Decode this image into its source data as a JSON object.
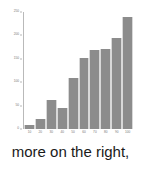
{
  "caption": "more on the right,",
  "colors": {
    "bar_fill": "#8c8c8c",
    "bar_edge": "#d8d8d8",
    "axis": "#b9b9b9",
    "tick_label": "#777777",
    "caption_text": "#1a1a1a",
    "background": "#ffffff"
  },
  "chart_data": {
    "type": "bar",
    "title": "",
    "xlabel": "",
    "ylabel": "",
    "categories": [
      "10",
      "20",
      "30",
      "40",
      "50",
      "60",
      "70",
      "80",
      "90",
      "100"
    ],
    "values": [
      8,
      22,
      62,
      45,
      110,
      152,
      168,
      172,
      195,
      240
    ],
    "ylim": [
      0,
      250
    ],
    "xlim": [
      5,
      105
    ],
    "yticks": [
      0,
      50,
      100,
      150,
      200,
      250
    ],
    "ytick_labels": [
      "0",
      "50",
      "100",
      "150",
      "200",
      "250"
    ],
    "xtick_labels": [
      "10",
      "20",
      "30",
      "40",
      "50",
      "60",
      "70",
      "80",
      "90",
      "100"
    ],
    "grid": false,
    "legend": false
  }
}
